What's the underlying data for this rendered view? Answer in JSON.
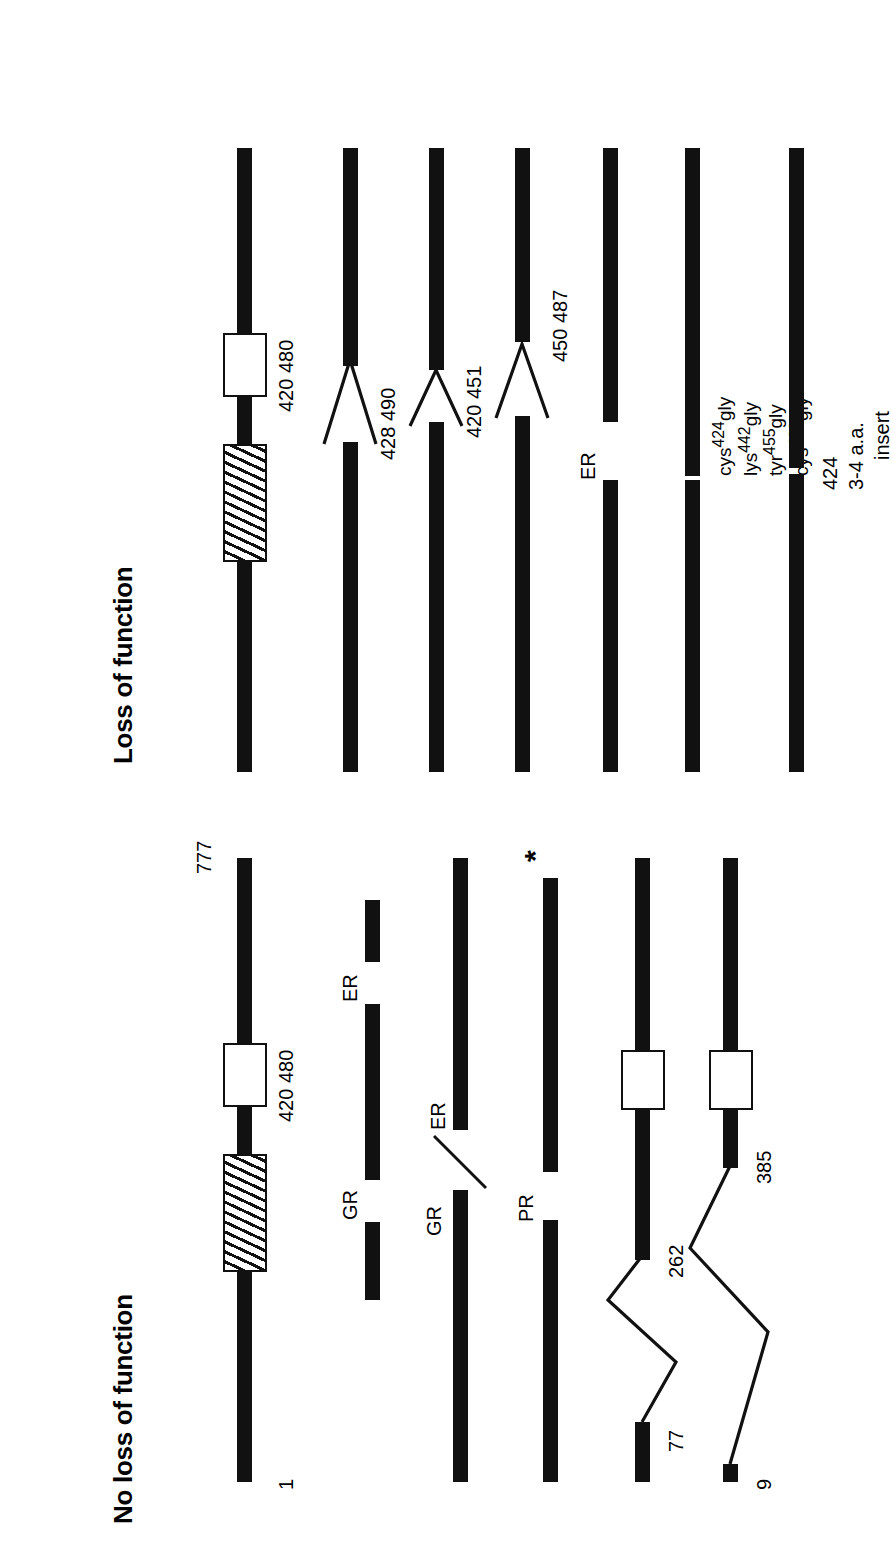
{
  "figure": {
    "type": "protein-domain-schematic",
    "orientation": "rotated-90-ccw",
    "groups": [
      {
        "id": "no-loss",
        "title": "No loss of function",
        "rows": [
          {
            "id": "wildtype",
            "labels": [
              "1",
              "777",
              "420 480"
            ],
            "start_label": "1",
            "end_label": "777",
            "domain_label": "420 480",
            "features": [
              "hatched-box",
              "open-box"
            ]
          },
          {
            "id": "gr-er-split",
            "labels": [
              "GR",
              "ER"
            ],
            "features": [
              "segment",
              "segment",
              "segment"
            ]
          },
          {
            "id": "gr-er-junction",
            "labels": [
              "GR",
              "ER"
            ],
            "features": [
              "segment",
              "diagonal-junction",
              "segment"
            ]
          },
          {
            "id": "pr",
            "labels": [
              "PR",
              "*"
            ],
            "features": [
              "segment",
              "segment",
              "asterisk"
            ]
          },
          {
            "id": "del-77-262",
            "labels": [
              "77",
              "262"
            ],
            "features": [
              "segment",
              "zigzag",
              "segment",
              "open-box"
            ]
          },
          {
            "id": "del-9-385",
            "labels": [
              "9",
              "385"
            ],
            "features": [
              "segment",
              "zigzag",
              "segment",
              "open-box"
            ]
          }
        ]
      },
      {
        "id": "loss",
        "title": "Loss of function",
        "rows": [
          {
            "id": "wt-ref",
            "labels": [
              "420 480"
            ],
            "features": [
              "hatched-box",
              "open-box"
            ]
          },
          {
            "id": "del-428-490",
            "labels": [
              "428 490"
            ],
            "features": [
              "v-notch"
            ]
          },
          {
            "id": "del-420-451",
            "labels": [
              "420 451"
            ],
            "features": [
              "v-notch"
            ]
          },
          {
            "id": "del-450-487",
            "labels": [
              "450 487"
            ],
            "features": [
              "v-notch"
            ]
          },
          {
            "id": "er-gap",
            "labels": [
              "ER"
            ],
            "features": [
              "segment",
              "segment"
            ]
          },
          {
            "id": "point-mutants",
            "labels": [
              "cys424gly",
              "lys442gly",
              "tyr455gly",
              "cys463gly"
            ],
            "mutations": [
              {
                "residue": "cys",
                "position": "424",
                "replacement": "gly"
              },
              {
                "residue": "lys",
                "position": "442",
                "replacement": "gly"
              },
              {
                "residue": "tyr",
                "position": "455",
                "replacement": "gly"
              },
              {
                "residue": "cys",
                "position": "463",
                "replacement": "gly"
              }
            ],
            "features": [
              "segment",
              "segment"
            ]
          },
          {
            "id": "insert-424",
            "labels": [
              "424",
              "3-4 a.a.",
              "insert"
            ],
            "position_label": "424",
            "insert_line1": "3-4 a.a.",
            "insert_line2": "insert",
            "features": [
              "segment",
              "segment"
            ]
          }
        ]
      }
    ]
  },
  "colors": {
    "ink": "#111111",
    "paper": "#ffffff"
  }
}
